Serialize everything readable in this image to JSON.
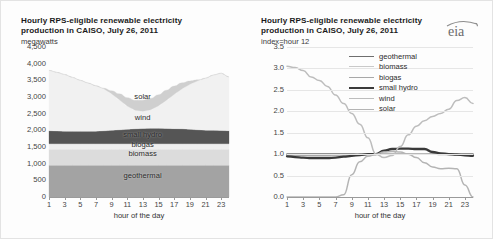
{
  "page": {
    "background": "#fdfdfd",
    "brand_logo": "eia-logo"
  },
  "left_panel": {
    "title": "Hourly RPS-eligible  renewable electricity\nproduction in CAISO, July 26, 2011",
    "unit_label": "megawatts",
    "xlabel": "hour of the day",
    "layer_labels": [
      "solar",
      "wind",
      "small hydro",
      "biogas",
      "biomass",
      "geothermal"
    ]
  },
  "right_panel": {
    "title": "Hourly RPS-eligible  renewable electricity\nproduction in CAISO, July 26, 2011",
    "unit_label": "index=hour 12",
    "xlabel": "hour of the day",
    "legend": [
      {
        "label": "geothermal",
        "color": "#6e6e6e",
        "width": 1.6
      },
      {
        "label": "biomass",
        "color": "#c9c9c9",
        "width": 1.3
      },
      {
        "label": "biogas",
        "color": "#a8a8a8",
        "width": 1.3
      },
      {
        "label": "small hydro",
        "color": "#3a3a3a",
        "width": 2.3
      },
      {
        "label": "wind",
        "color": "#bdbdbd",
        "width": 1.5
      },
      {
        "label": "solar",
        "color": "#b4b4b4",
        "width": 1.5
      }
    ]
  },
  "chart_data": [
    {
      "type": "area",
      "title": "Hourly RPS-eligible renewable electricity production in CAISO, July 26, 2011",
      "xlabel": "hour of the day",
      "ylabel": "megawatts",
      "ylim": [
        0,
        4500
      ],
      "yticks": [
        "0",
        "500",
        "1,000",
        "1,500",
        "2,000",
        "2,500",
        "3,000",
        "3,500",
        "4,000",
        "4,500"
      ],
      "ytick_values": [
        0,
        500,
        1000,
        1500,
        2000,
        2500,
        3000,
        3500,
        4000,
        4500
      ],
      "xticks": [
        "1",
        "3",
        "5",
        "7",
        "9",
        "11",
        "13",
        "15",
        "17",
        "19",
        "21",
        "23"
      ],
      "x": [
        1,
        2,
        3,
        4,
        5,
        6,
        7,
        8,
        9,
        10,
        11,
        12,
        13,
        14,
        15,
        16,
        17,
        18,
        19,
        20,
        21,
        22,
        23,
        24
      ],
      "stacked": true,
      "grid": false,
      "legend_position": "inline-labels",
      "series": [
        {
          "name": "geothermal",
          "color": "#a3a3a3",
          "values": [
            950,
            950,
            950,
            950,
            950,
            950,
            950,
            950,
            950,
            950,
            950,
            950,
            950,
            950,
            950,
            950,
            950,
            950,
            950,
            950,
            950,
            950,
            950,
            950
          ]
        },
        {
          "name": "biomass",
          "color": "#dcdcdc",
          "values": [
            480,
            480,
            480,
            480,
            480,
            480,
            480,
            480,
            480,
            480,
            480,
            480,
            480,
            480,
            480,
            480,
            480,
            480,
            480,
            480,
            480,
            480,
            480,
            480
          ]
        },
        {
          "name": "biogas",
          "color": "#efefef",
          "values": [
            170,
            170,
            170,
            170,
            170,
            170,
            170,
            170,
            170,
            170,
            170,
            170,
            170,
            170,
            170,
            170,
            170,
            170,
            170,
            170,
            170,
            170,
            170,
            170
          ]
        },
        {
          "name": "small hydro",
          "color": "#555555",
          "values": [
            390,
            380,
            375,
            370,
            370,
            370,
            375,
            385,
            400,
            415,
            430,
            445,
            455,
            460,
            460,
            455,
            450,
            445,
            430,
            415,
            405,
            400,
            395,
            390
          ]
        },
        {
          "name": "wind",
          "color": "#f1f1f1",
          "values": [
            1810,
            1760,
            1700,
            1620,
            1530,
            1450,
            1360,
            1260,
            1100,
            900,
            700,
            560,
            520,
            560,
            680,
            850,
            1030,
            1200,
            1350,
            1470,
            1560,
            1660,
            1720,
            1610
          ]
        },
        {
          "name": "solar",
          "color": "#cfcfcf",
          "values": [
            0,
            0,
            0,
            0,
            0,
            0,
            0,
            20,
            90,
            180,
            250,
            300,
            330,
            340,
            330,
            300,
            250,
            180,
            100,
            30,
            0,
            0,
            0,
            0
          ]
        }
      ]
    },
    {
      "type": "line",
      "title": "Hourly RPS-eligible renewable electricity production in CAISO, July 26, 2011",
      "xlabel": "hour of the day",
      "ylabel": "index=hour 12",
      "ylim": [
        0,
        3.5
      ],
      "yticks": [
        "0.0",
        "0.5",
        "1.0",
        "1.5",
        "2.0",
        "2.5",
        "3.0",
        "3.5"
      ],
      "ytick_values": [
        0.0,
        0.5,
        1.0,
        1.5,
        2.0,
        2.5,
        3.0,
        3.5
      ],
      "xticks": [
        "1",
        "3",
        "5",
        "7",
        "9",
        "11",
        "13",
        "15",
        "17",
        "19",
        "21",
        "23"
      ],
      "x": [
        1,
        2,
        3,
        4,
        5,
        6,
        7,
        8,
        9,
        10,
        11,
        12,
        13,
        14,
        15,
        16,
        17,
        18,
        19,
        20,
        21,
        22,
        23,
        24
      ],
      "grid": true,
      "legend_position": "upper-center",
      "series": [
        {
          "name": "geothermal",
          "color": "#6e6e6e",
          "width": 1.6,
          "values": [
            1.0,
            1.0,
            1.0,
            1.0,
            1.0,
            1.0,
            1.0,
            1.0,
            1.0,
            1.0,
            1.0,
            1.0,
            1.0,
            1.0,
            1.0,
            1.0,
            1.0,
            1.0,
            1.0,
            1.0,
            1.0,
            1.0,
            1.0,
            1.0
          ]
        },
        {
          "name": "biomass",
          "color": "#c9c9c9",
          "width": 1.3,
          "values": [
            0.98,
            0.98,
            0.98,
            0.98,
            0.98,
            0.98,
            0.98,
            0.99,
            0.99,
            1.0,
            1.0,
            1.0,
            1.01,
            1.01,
            1.01,
            1.01,
            1.01,
            1.01,
            1.0,
            1.0,
            0.99,
            0.99,
            0.98,
            0.98
          ]
        },
        {
          "name": "biogas",
          "color": "#a8a8a8",
          "width": 1.3,
          "values": [
            0.97,
            0.97,
            0.97,
            0.97,
            0.97,
            0.97,
            0.98,
            0.98,
            0.99,
            0.99,
            1.0,
            1.0,
            1.0,
            1.0,
            1.0,
            1.0,
            1.0,
            1.0,
            1.0,
            0.99,
            0.99,
            0.98,
            0.98,
            0.97
          ]
        },
        {
          "name": "small hydro",
          "color": "#3a3a3a",
          "width": 2.3,
          "values": [
            0.95,
            0.93,
            0.92,
            0.91,
            0.91,
            0.91,
            0.92,
            0.94,
            0.96,
            0.98,
            1.0,
            1.0,
            1.08,
            1.12,
            1.13,
            1.13,
            1.12,
            1.12,
            1.05,
            1.02,
            1.0,
            0.99,
            0.97,
            0.96
          ]
        },
        {
          "name": "wind",
          "color": "#bdbdbd",
          "width": 1.5,
          "values": [
            3.05,
            3.02,
            2.95,
            2.8,
            2.72,
            2.58,
            2.38,
            2.18,
            1.95,
            1.7,
            1.38,
            1.0,
            0.92,
            0.97,
            1.18,
            1.45,
            1.65,
            1.78,
            1.88,
            1.95,
            2.05,
            2.25,
            2.32,
            2.18
          ]
        },
        {
          "name": "solar",
          "color": "#b4b4b4",
          "width": 1.5,
          "values": [
            0.0,
            0.0,
            0.0,
            0.0,
            0.0,
            0.0,
            0.0,
            0.05,
            0.52,
            0.82,
            0.95,
            1.0,
            1.05,
            1.06,
            1.05,
            1.0,
            0.92,
            0.8,
            0.7,
            0.66,
            0.67,
            0.66,
            0.28,
            0.0
          ]
        }
      ]
    }
  ]
}
